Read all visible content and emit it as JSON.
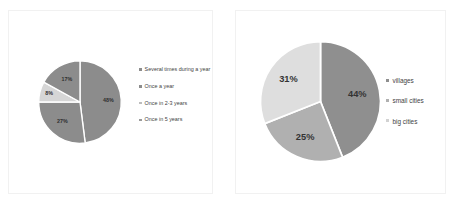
{
  "chart_data": [
    {
      "type": "pie",
      "id": "survey-frequency-pie",
      "title": "",
      "legend_position": "right",
      "categories": [
        "Several times during a year",
        "Once a year",
        "Once in 2-3 years",
        "Once in 5 years"
      ],
      "values": [
        48,
        27,
        8,
        17
      ],
      "labels": [
        "48%",
        "27%",
        "8%",
        "17%"
      ],
      "colors": [
        "#8c8c8c",
        "#8c8c8c",
        "#d6d6d6",
        "#8c8c8c"
      ],
      "legend_swatch_colors": [
        "#8c8c8c",
        "#8c8c8c",
        "#bdbdbd",
        "#9a9a9a"
      ]
    },
    {
      "type": "pie",
      "id": "settlement-type-pie",
      "title": "",
      "legend_position": "right",
      "categories": [
        "villages",
        "small cities",
        "big cities"
      ],
      "values": [
        44,
        25,
        31
      ],
      "labels": [
        "44%",
        "25%",
        "31%"
      ],
      "colors": [
        "#8f8f8f",
        "#b0b0b0",
        "#dedede"
      ],
      "legend_swatch_colors": [
        "#8f8f8f",
        "#b0b0b0",
        "#d2d2d2"
      ]
    }
  ],
  "charts": {
    "left": {
      "slices": [
        {
          "label": "48%",
          "value": 48,
          "name": "Several times during a year"
        },
        {
          "label": "27%",
          "value": 27,
          "name": "Once a year"
        },
        {
          "label": "8%",
          "value": 8,
          "name": "Once in 2-3 years"
        },
        {
          "label": "17%",
          "value": 17,
          "name": "Once in 5 years"
        }
      ],
      "legend": [
        "Several times during a year",
        "Once a year",
        "Once in 2-3 years",
        "Once in 5 years"
      ]
    },
    "right": {
      "slices": [
        {
          "label": "44%",
          "value": 44,
          "name": "villages"
        },
        {
          "label": "25%",
          "value": 25,
          "name": "small cities"
        },
        {
          "label": "31%",
          "value": 31,
          "name": "big cities"
        }
      ],
      "legend": [
        "villages",
        "small cities",
        "big cities"
      ]
    }
  }
}
